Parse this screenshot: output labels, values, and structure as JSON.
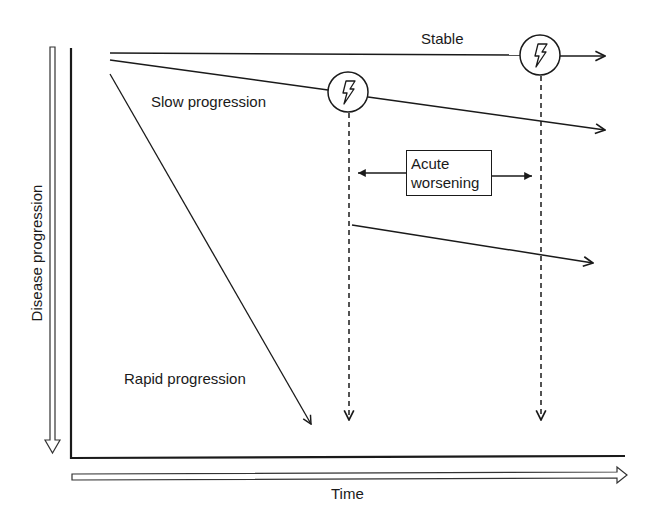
{
  "diagram": {
    "axes": {
      "y_label": "Disease progression",
      "x_label": "Time"
    },
    "trajectories": [
      {
        "id": "stable",
        "label": "Stable"
      },
      {
        "id": "slow",
        "label": "Slow progression"
      },
      {
        "id": "rapid",
        "label": "Rapid progression"
      }
    ],
    "event_box": {
      "line1": "Acute",
      "line2": "worsening"
    },
    "event_markers": [
      {
        "id": "event-1",
        "icon": "lightning-bolt-icon"
      },
      {
        "id": "event-2",
        "icon": "lightning-bolt-icon"
      }
    ],
    "colors": {
      "stroke": "#1a1a1a",
      "background": "#ffffff"
    }
  }
}
